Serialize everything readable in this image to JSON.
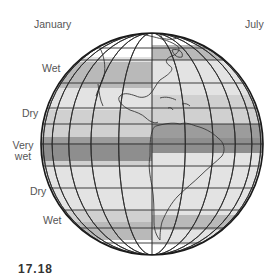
{
  "figure": {
    "title_left": "January",
    "title_right": "July",
    "figure_number_fragment": "17.18"
  },
  "zone_labels": [
    {
      "id": "wet-north",
      "text": "Wet",
      "x": 42,
      "y": 68
    },
    {
      "id": "dry-north",
      "text": "Dry",
      "x": 22,
      "y": 108
    },
    {
      "id": "very-wet",
      "text_line1": "Very",
      "text_line2": "wet",
      "x": 12,
      "y": 145
    },
    {
      "id": "dry-south",
      "text": "Dry",
      "x": 30,
      "y": 191
    },
    {
      "id": "wet-south",
      "text": "Wet",
      "x": 43,
      "y": 220
    }
  ],
  "colors": {
    "white": "#ffffff",
    "light": "#e3e3e3",
    "lightmid": "#d0d0d0",
    "mid": "#b9b9b9",
    "dark": "#9c9c9c",
    "darker": "#8e8e8e",
    "grid": "#2a2a2a",
    "outline": "#1a1a1a",
    "label_text": "#555555"
  },
  "globe": {
    "cx": 152,
    "cy": 144,
    "r": 111,
    "january_bands": [
      {
        "y0": 20,
        "y1": 57,
        "tone": "white"
      },
      {
        "y0": 57,
        "y1": 62,
        "tone": "light"
      },
      {
        "y0": 62,
        "y1": 88,
        "tone": "mid"
      },
      {
        "y0": 88,
        "y1": 110,
        "tone": "light"
      },
      {
        "y0": 110,
        "y1": 137,
        "tone": "lightmid"
      },
      {
        "y0": 137,
        "y1": 143,
        "tone": "dark"
      },
      {
        "y0": 143,
        "y1": 161,
        "tone": "darker"
      },
      {
        "y0": 161,
        "y1": 167,
        "tone": "lightmid"
      },
      {
        "y0": 167,
        "y1": 210,
        "tone": "light"
      },
      {
        "y0": 210,
        "y1": 222,
        "tone": "lightmid"
      },
      {
        "y0": 222,
        "y1": 240,
        "tone": "mid"
      },
      {
        "y0": 240,
        "y1": 270,
        "tone": "white"
      }
    ],
    "july_bands": [
      {
        "y0": 20,
        "y1": 45,
        "tone": "white"
      },
      {
        "y0": 45,
        "y1": 60,
        "tone": "mid"
      },
      {
        "y0": 60,
        "y1": 95,
        "tone": "light"
      },
      {
        "y0": 95,
        "y1": 124,
        "tone": "lightmid"
      },
      {
        "y0": 124,
        "y1": 138,
        "tone": "dark"
      },
      {
        "y0": 138,
        "y1": 153,
        "tone": "darker"
      },
      {
        "y0": 153,
        "y1": 215,
        "tone": "light"
      },
      {
        "y0": 215,
        "y1": 230,
        "tone": "mid"
      },
      {
        "y0": 230,
        "y1": 245,
        "tone": "light"
      },
      {
        "y0": 245,
        "y1": 270,
        "tone": "white"
      }
    ],
    "parallels_y": [
      48,
      60,
      83,
      108,
      124,
      144,
      166,
      188,
      210,
      228,
      243
    ],
    "meridian_offsets": [
      -0.98,
      -0.9,
      -0.75,
      -0.55,
      -0.3,
      0,
      0.3,
      0.55,
      0.75,
      0.9,
      0.98
    ]
  }
}
